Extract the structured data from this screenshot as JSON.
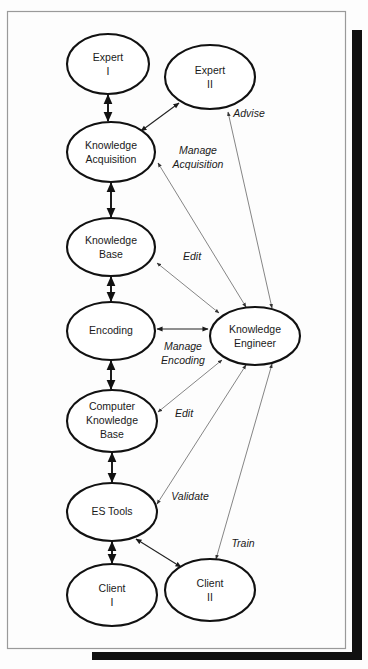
{
  "figure": {
    "type": "node-link-diagram",
    "background_color": "#fdfdfd",
    "frame_color": "#9a9a9a",
    "node_stroke_color": "#111111",
    "thin_edge_color": "#6f6f6f"
  },
  "nodes": [
    {
      "id": "expert-1",
      "lines": [
        "Expert",
        "I"
      ],
      "cx": 108,
      "cy": 64,
      "rx": 41,
      "ry": 30
    },
    {
      "id": "expert-2",
      "lines": [
        "Expert",
        "II"
      ],
      "cx": 210,
      "cy": 77,
      "rx": 45,
      "ry": 32
    },
    {
      "id": "knowledge-acquisition",
      "lines": [
        "Knowledge",
        "Acquisition"
      ],
      "cx": 111,
      "cy": 152,
      "rx": 44,
      "ry": 30
    },
    {
      "id": "knowledge-base",
      "lines": [
        "Knowledge",
        "Base"
      ],
      "cx": 111,
      "cy": 247,
      "rx": 44,
      "ry": 29
    },
    {
      "id": "encoding",
      "lines": [
        "Encoding"
      ],
      "cx": 111,
      "cy": 331,
      "rx": 44,
      "ry": 29
    },
    {
      "id": "knowledge-engineer",
      "lines": [
        "Knowledge",
        "Engineer"
      ],
      "cx": 255,
      "cy": 336,
      "rx": 45,
      "ry": 29
    },
    {
      "id": "computer-knowledge-base",
      "lines": [
        "Computer",
        "Knowledge",
        "Base"
      ],
      "cx": 112,
      "cy": 421,
      "rx": 45,
      "ry": 31
    },
    {
      "id": "es-tools",
      "lines": [
        "ES Tools"
      ],
      "cx": 112,
      "cy": 512,
      "rx": 45,
      "ry": 29
    },
    {
      "id": "client-1",
      "lines": [
        "Client",
        "I"
      ],
      "cx": 112,
      "cy": 595,
      "rx": 45,
      "ry": 31
    },
    {
      "id": "client-2",
      "lines": [
        "Client",
        "II"
      ],
      "cx": 210,
      "cy": 590,
      "rx": 45,
      "ry": 31
    }
  ],
  "edges": [
    {
      "id": "expert1-knowledge-acquisition",
      "from": "expert-1",
      "to": "knowledge-acquisition",
      "label": "",
      "arrows": "both",
      "weight": "thick"
    },
    {
      "id": "knowledge-acquisition-expert2",
      "from": "knowledge-acquisition",
      "to": "expert-2",
      "label": "",
      "arrows": "both",
      "weight": "mid"
    },
    {
      "id": "knowledge-acquisition-knowledge-base",
      "from": "knowledge-acquisition",
      "to": "knowledge-base",
      "label": "",
      "arrows": "both",
      "weight": "thick"
    },
    {
      "id": "knowledge-base-encoding",
      "from": "knowledge-base",
      "to": "encoding",
      "label": "",
      "arrows": "both",
      "weight": "thick"
    },
    {
      "id": "encoding-computer-knowledge-base",
      "from": "encoding",
      "to": "computer-knowledge-base",
      "label": "",
      "arrows": "both",
      "weight": "thick"
    },
    {
      "id": "computer-knowledge-base-es-tools",
      "from": "computer-knowledge-base",
      "to": "es-tools",
      "label": "",
      "arrows": "both",
      "weight": "thick"
    },
    {
      "id": "es-tools-client1",
      "from": "es-tools",
      "to": "client-1",
      "label": "",
      "arrows": "both",
      "weight": "thick"
    },
    {
      "id": "es-tools-client2",
      "from": "es-tools",
      "to": "client-2",
      "label": "",
      "arrows": "both",
      "weight": "mid"
    },
    {
      "id": "knowledge-engineer-expert2",
      "from": "knowledge-engineer",
      "to": "expert-2",
      "label": "Advise",
      "arrows": "both",
      "weight": "thin"
    },
    {
      "id": "knowledge-engineer-knowledge-acquisition",
      "from": "knowledge-engineer",
      "to": "knowledge-acquisition",
      "label": "Manage Acquisition",
      "arrows": "both",
      "weight": "thin"
    },
    {
      "id": "knowledge-engineer-knowledge-base",
      "from": "knowledge-engineer",
      "to": "knowledge-base",
      "label": "Edit",
      "arrows": "both",
      "weight": "thin"
    },
    {
      "id": "knowledge-engineer-encoding",
      "from": "knowledge-engineer",
      "to": "encoding",
      "label": "Manage Encoding",
      "arrows": "both",
      "weight": "mid"
    },
    {
      "id": "knowledge-engineer-computer-knowledge-base",
      "from": "knowledge-engineer",
      "to": "computer-knowledge-base",
      "label": "Edit",
      "arrows": "both",
      "weight": "thin"
    },
    {
      "id": "knowledge-engineer-es-tools",
      "from": "knowledge-engineer",
      "to": "es-tools",
      "label": "Validate",
      "arrows": "both",
      "weight": "thin"
    },
    {
      "id": "knowledge-engineer-client2",
      "from": "knowledge-engineer",
      "to": "client-2",
      "label": "Train",
      "arrows": "both",
      "weight": "thin"
    }
  ],
  "edge_labels": {
    "advise": "Advise",
    "manage_acquisition_line1": "Manage",
    "manage_acquisition_line2": "Acquisition",
    "edit_knowledge_base": "Edit",
    "manage_encoding_line1": "Manage",
    "manage_encoding_line2": "Encoding",
    "edit_computer_knowledge_base": "Edit",
    "validate": "Validate",
    "train": "Train"
  },
  "node_text": {
    "expert_1_line1": "Expert",
    "expert_1_line2": "I",
    "expert_2_line1": "Expert",
    "expert_2_line2": "II",
    "knowledge_acquisition_line1": "Knowledge",
    "knowledge_acquisition_line2": "Acquisition",
    "knowledge_base_line1": "Knowledge",
    "knowledge_base_line2": "Base",
    "encoding_line1": "Encoding",
    "knowledge_engineer_line1": "Knowledge",
    "knowledge_engineer_line2": "Engineer",
    "computer_knowledge_base_line1": "Computer",
    "computer_knowledge_base_line2": "Knowledge",
    "computer_knowledge_base_line3": "Base",
    "es_tools_line1": "ES Tools",
    "client_1_line1": "Client",
    "client_1_line2": "I",
    "client_2_line1": "Client",
    "client_2_line2": "II"
  }
}
